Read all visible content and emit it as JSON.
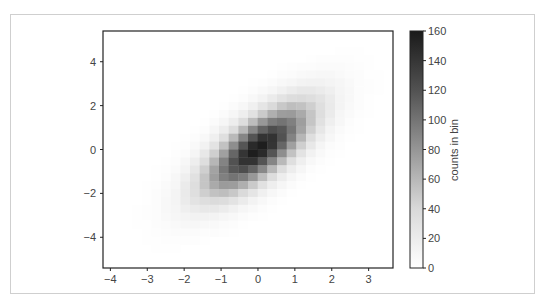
{
  "chart_data": {
    "type": "heatmap",
    "subtype": "hist2d",
    "title": "",
    "xlabel": "",
    "ylabel": "",
    "colormap": "Greys",
    "color_low": "#ffffff",
    "color_high": "#000000",
    "xlim": [
      -4.2,
      3.66
    ],
    "ylim": [
      -5.4,
      5.4
    ],
    "bins": [
      30,
      30
    ],
    "x_ticks": [
      -4,
      -3,
      -2,
      -1,
      0,
      1,
      2,
      3
    ],
    "x_tick_labels": [
      "−4",
      "−3",
      "−2",
      "−1",
      "0",
      "1",
      "2",
      "3"
    ],
    "y_ticks": [
      4,
      2,
      0,
      -2,
      -4
    ],
    "y_tick_labels": [
      "4",
      "2",
      "0",
      "−2",
      "−4"
    ],
    "grid": false,
    "colorbar": {
      "label": "counts in bin",
      "min": 0,
      "max": 160,
      "ticks": [
        0,
        20,
        40,
        60,
        80,
        100,
        120,
        140,
        160
      ],
      "tick_labels": [
        "0",
        "20",
        "40",
        "60",
        "80",
        "100",
        "120",
        "140",
        "160"
      ]
    },
    "counts_note": "rows ordered top (y high) to bottom (y low); columns left (x low) to right (x high)",
    "counts": [
      [
        0,
        0,
        0,
        0,
        0,
        0,
        0,
        0,
        0,
        0,
        0,
        0,
        0,
        0,
        0,
        0,
        0,
        0,
        0,
        0,
        0,
        0,
        0,
        0,
        0,
        0,
        0,
        0,
        0,
        0
      ],
      [
        0,
        0,
        0,
        0,
        0,
        0,
        0,
        0,
        0,
        0,
        0,
        0,
        0,
        0,
        0,
        0,
        0,
        0,
        0,
        0,
        0,
        0,
        0,
        0,
        0,
        0,
        0,
        0,
        0,
        0
      ],
      [
        0,
        0,
        0,
        0,
        0,
        0,
        0,
        0,
        0,
        0,
        0,
        0,
        0,
        0,
        0,
        0,
        0,
        0,
        0,
        0,
        0,
        0,
        0,
        0,
        1,
        1,
        1,
        0,
        0,
        0
      ],
      [
        0,
        0,
        0,
        0,
        0,
        0,
        0,
        0,
        0,
        0,
        0,
        0,
        0,
        0,
        0,
        0,
        0,
        0,
        0,
        0,
        0,
        1,
        2,
        2,
        2,
        2,
        1,
        1,
        0,
        0
      ],
      [
        0,
        0,
        0,
        0,
        0,
        0,
        0,
        0,
        0,
        0,
        0,
        0,
        0,
        0,
        0,
        0,
        0,
        0,
        1,
        2,
        3,
        3,
        4,
        4,
        4,
        3,
        2,
        1,
        0,
        0
      ],
      [
        0,
        0,
        0,
        0,
        0,
        0,
        0,
        0,
        0,
        0,
        0,
        0,
        0,
        0,
        0,
        0,
        0,
        1,
        3,
        4,
        6,
        7,
        8,
        8,
        6,
        4,
        3,
        1,
        1,
        0
      ],
      [
        0,
        0,
        0,
        0,
        0,
        0,
        0,
        0,
        0,
        0,
        0,
        0,
        0,
        0,
        0,
        1,
        2,
        4,
        7,
        10,
        13,
        14,
        14,
        12,
        9,
        6,
        3,
        2,
        1,
        0
      ],
      [
        0,
        0,
        0,
        0,
        0,
        0,
        0,
        0,
        0,
        0,
        0,
        0,
        0,
        0,
        1,
        3,
        6,
        10,
        15,
        20,
        24,
        24,
        21,
        17,
        11,
        7,
        3,
        2,
        1,
        0
      ],
      [
        0,
        0,
        0,
        0,
        0,
        0,
        0,
        0,
        0,
        0,
        0,
        0,
        0,
        1,
        3,
        7,
        13,
        21,
        29,
        36,
        38,
        35,
        29,
        21,
        12,
        7,
        3,
        1,
        0,
        0
      ],
      [
        0,
        0,
        0,
        0,
        0,
        0,
        0,
        0,
        0,
        0,
        0,
        0,
        1,
        4,
        8,
        16,
        27,
        39,
        50,
        56,
        54,
        46,
        34,
        22,
        12,
        6,
        3,
        1,
        0,
        0
      ],
      [
        0,
        0,
        0,
        0,
        0,
        0,
        0,
        0,
        0,
        0,
        0,
        1,
        4,
        9,
        18,
        32,
        49,
        65,
        76,
        77,
        68,
        52,
        35,
        21,
        10,
        5,
        2,
        1,
        0,
        0
      ],
      [
        0,
        0,
        0,
        0,
        0,
        0,
        0,
        0,
        0,
        0,
        1,
        4,
        9,
        19,
        36,
        57,
        79,
        95,
        100,
        93,
        75,
        52,
        32,
        17,
        8,
        3,
        1,
        0,
        0,
        0
      ],
      [
        0,
        0,
        0,
        0,
        0,
        0,
        0,
        0,
        0,
        1,
        3,
        9,
        19,
        36,
        60,
        88,
        110,
        122,
        117,
        98,
        72,
        46,
        25,
        12,
        5,
        2,
        1,
        0,
        0,
        0
      ],
      [
        0,
        0,
        0,
        0,
        0,
        0,
        0,
        0,
        1,
        3,
        7,
        17,
        34,
        59,
        90,
        119,
        137,
        137,
        120,
        91,
        61,
        35,
        18,
        8,
        3,
        1,
        0,
        0,
        0,
        0
      ],
      [
        0,
        0,
        0,
        0,
        0,
        0,
        0,
        1,
        2,
        6,
        14,
        30,
        54,
        85,
        118,
        142,
        149,
        136,
        108,
        74,
        46,
        24,
        11,
        4,
        2,
        0,
        0,
        0,
        0,
        0
      ],
      [
        0,
        0,
        0,
        0,
        0,
        0,
        0,
        2,
        4,
        11,
        24,
        46,
        74,
        108,
        136,
        149,
        142,
        118,
        85,
        54,
        30,
        14,
        6,
        2,
        1,
        0,
        0,
        0,
        0,
        0
      ],
      [
        0,
        0,
        0,
        0,
        0,
        0,
        1,
        3,
        8,
        18,
        35,
        61,
        91,
        120,
        137,
        137,
        119,
        90,
        59,
        34,
        17,
        7,
        3,
        1,
        0,
        0,
        0,
        0,
        0,
        0
      ],
      [
        0,
        0,
        0,
        0,
        0,
        1,
        2,
        5,
        12,
        25,
        46,
        72,
        98,
        117,
        122,
        110,
        88,
        60,
        36,
        19,
        9,
        3,
        1,
        0,
        0,
        0,
        0,
        0,
        0,
        0
      ],
      [
        0,
        0,
        0,
        0,
        0,
        1,
        3,
        8,
        17,
        32,
        52,
        75,
        93,
        100,
        95,
        79,
        57,
        36,
        19,
        9,
        4,
        1,
        0,
        0,
        0,
        0,
        0,
        0,
        0,
        0
      ],
      [
        0,
        0,
        0,
        0,
        1,
        2,
        5,
        10,
        21,
        35,
        52,
        68,
        77,
        76,
        65,
        49,
        32,
        18,
        9,
        4,
        1,
        0,
        0,
        0,
        0,
        0,
        0,
        0,
        0,
        0
      ],
      [
        0,
        0,
        0,
        0,
        1,
        3,
        6,
        12,
        22,
        34,
        46,
        54,
        56,
        50,
        39,
        27,
        16,
        8,
        4,
        1,
        0,
        0,
        0,
        0,
        0,
        0,
        0,
        0,
        0,
        0
      ],
      [
        0,
        0,
        0,
        0,
        1,
        3,
        7,
        12,
        21,
        29,
        35,
        38,
        36,
        29,
        21,
        13,
        7,
        3,
        1,
        0,
        0,
        0,
        0,
        0,
        0,
        0,
        0,
        0,
        0,
        0
      ],
      [
        0,
        0,
        0,
        1,
        2,
        3,
        7,
        11,
        17,
        21,
        24,
        24,
        20,
        15,
        10,
        6,
        3,
        1,
        0,
        0,
        0,
        0,
        0,
        0,
        0,
        0,
        0,
        0,
        0,
        0
      ],
      [
        0,
        0,
        0,
        1,
        2,
        3,
        6,
        9,
        12,
        14,
        14,
        13,
        10,
        7,
        4,
        2,
        1,
        0,
        0,
        0,
        0,
        0,
        0,
        0,
        0,
        0,
        0,
        0,
        0,
        0
      ],
      [
        0,
        0,
        0,
        1,
        1,
        3,
        4,
        6,
        8,
        8,
        7,
        6,
        4,
        3,
        1,
        0,
        0,
        0,
        0,
        0,
        0,
        0,
        0,
        0,
        0,
        0,
        0,
        0,
        0,
        0
      ],
      [
        0,
        0,
        0,
        0,
        1,
        2,
        3,
        4,
        4,
        4,
        3,
        3,
        2,
        1,
        0,
        0,
        0,
        0,
        0,
        0,
        0,
        0,
        0,
        0,
        0,
        0,
        0,
        0,
        0,
        0
      ],
      [
        0,
        0,
        0,
        0,
        1,
        1,
        2,
        2,
        2,
        2,
        1,
        0,
        0,
        0,
        0,
        0,
        0,
        0,
        0,
        0,
        0,
        0,
        0,
        0,
        0,
        0,
        0,
        0,
        0,
        0
      ],
      [
        0,
        0,
        0,
        0,
        0,
        1,
        1,
        1,
        0,
        0,
        0,
        0,
        0,
        0,
        0,
        0,
        0,
        0,
        0,
        0,
        0,
        0,
        0,
        0,
        0,
        0,
        0,
        0,
        0,
        0
      ],
      [
        0,
        0,
        0,
        0,
        0,
        0,
        0,
        0,
        0,
        0,
        0,
        0,
        0,
        0,
        0,
        0,
        0,
        0,
        0,
        0,
        0,
        0,
        0,
        0,
        0,
        0,
        0,
        0,
        0,
        0
      ],
      [
        0,
        0,
        0,
        0,
        0,
        0,
        0,
        0,
        0,
        0,
        0,
        0,
        0,
        0,
        0,
        0,
        0,
        0,
        0,
        0,
        0,
        0,
        0,
        0,
        0,
        0,
        0,
        0,
        0,
        0
      ]
    ]
  }
}
